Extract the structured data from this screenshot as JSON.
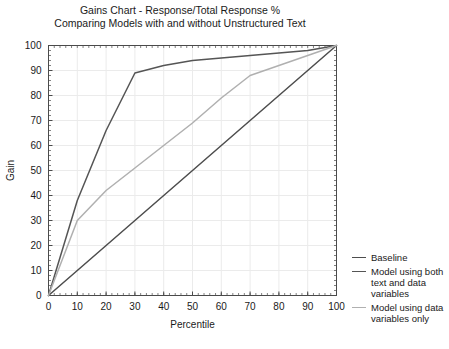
{
  "chart_data": {
    "type": "line",
    "title": "Gains Chart - Response/Total Response %",
    "subtitle": "Comparing Models with and without Unstructured Text",
    "xlabel": "Percentile",
    "ylabel": "Gain",
    "xlim": [
      0,
      100
    ],
    "ylim": [
      0,
      100
    ],
    "xticks": [
      0,
      10,
      20,
      30,
      40,
      50,
      60,
      70,
      80,
      90,
      100
    ],
    "yticks": [
      0,
      10,
      20,
      30,
      40,
      50,
      60,
      70,
      80,
      90,
      100
    ],
    "grid": true,
    "minor_ticks": true,
    "legend_position": "right",
    "series": [
      {
        "name": "Baseline",
        "color": "#4d4d4d",
        "x": [
          0,
          100
        ],
        "values": [
          0,
          100
        ]
      },
      {
        "name": "Model using both text and data variables",
        "color": "#555555",
        "x": [
          0,
          10,
          20,
          30,
          40,
          50,
          60,
          70,
          80,
          90,
          100
        ],
        "values": [
          0,
          38,
          66,
          89,
          92,
          94,
          95,
          96,
          97,
          98,
          100
        ]
      },
      {
        "name": "Model using data variables only",
        "color": "#b0b0b0",
        "x": [
          0,
          10,
          20,
          30,
          40,
          50,
          60,
          70,
          80,
          90,
          100
        ],
        "values": [
          0,
          30,
          42,
          51,
          60,
          69,
          79,
          88,
          92,
          96,
          100
        ]
      }
    ]
  },
  "legend": {
    "items": [
      {
        "label": "Baseline",
        "color": "#4d4d4d"
      },
      {
        "label": "Model using both text and data variables",
        "color": "#555555"
      },
      {
        "label": "Model using data variables only",
        "color": "#b0b0b0"
      }
    ]
  },
  "colors": {
    "axis": "#4a4a4a",
    "grid": "#ebebeb",
    "text": "#1a1a1a",
    "background": "#ffffff"
  }
}
